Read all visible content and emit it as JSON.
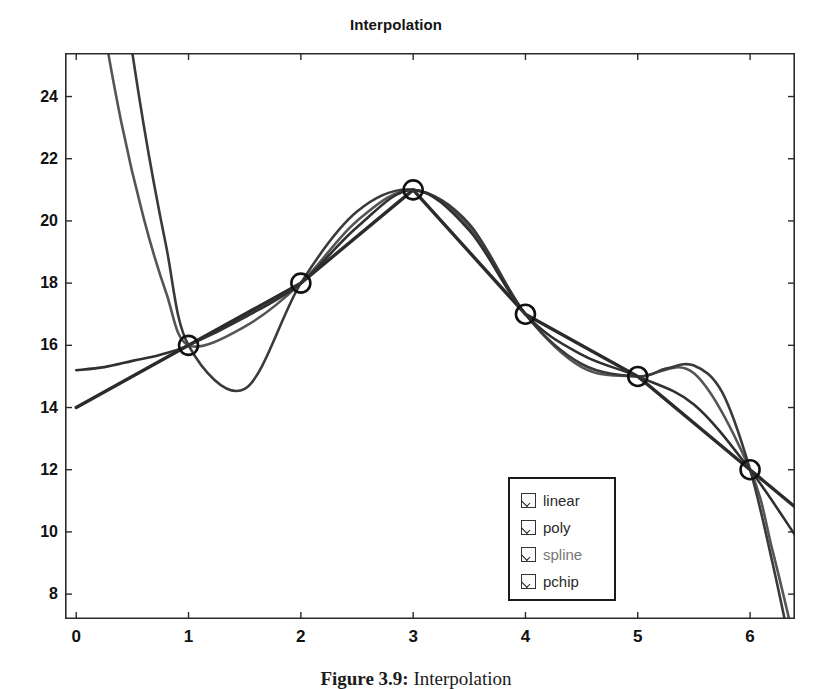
{
  "figure": {
    "caption_bold": "Figure 3.9:",
    "caption_rest": " Interpolation"
  },
  "chart_data": {
    "type": "line",
    "title": "Interpolation",
    "xlabel": "",
    "ylabel": "",
    "xlim": [
      -0.1,
      6.4
    ],
    "ylim": [
      7.2,
      25.4
    ],
    "xticks": [
      0,
      1,
      2,
      3,
      4,
      5,
      6
    ],
    "xtick_labels": [
      "0",
      "1",
      "2",
      "3",
      "4",
      "5",
      "6"
    ],
    "yticks": [
      8,
      10,
      12,
      14,
      16,
      18,
      20,
      22,
      24
    ],
    "ytick_labels": [
      "8",
      "10",
      "12",
      "14",
      "16",
      "18",
      "20",
      "22",
      "24"
    ],
    "grid": false,
    "legend_position": "lower-right",
    "markers": {
      "name": "data points",
      "symbol": "circle-open",
      "x": [
        1,
        2,
        3,
        4,
        5,
        6
      ],
      "y": [
        16,
        18,
        21,
        17,
        15,
        12
      ]
    },
    "series": [
      {
        "name": "linear",
        "color": "#2b2b2b",
        "x": [
          0,
          1,
          2,
          3,
          4,
          5,
          6,
          6.4
        ],
        "y": [
          14.0,
          16.0,
          18.0,
          21.0,
          17.0,
          15.0,
          12.0,
          10.8
        ]
      },
      {
        "name": "poly",
        "color": "#555555",
        "x": [
          0,
          0.2,
          0.4,
          0.6,
          0.8,
          1.0,
          1.5,
          2.0,
          2.5,
          3.0,
          3.5,
          4.0,
          4.5,
          5.0,
          5.5,
          6.0,
          6.2,
          6.4
        ],
        "y": [
          32.0,
          27.2,
          23.2,
          20.1,
          17.7,
          16.0,
          16.6,
          18.0,
          20.0,
          21.0,
          19.8,
          17.0,
          15.3,
          15.0,
          15.1,
          12.0,
          9.4,
          6.4
        ]
      },
      {
        "name": "spline",
        "color": "#3a3a3a",
        "x": [
          0,
          0.2,
          0.4,
          0.6,
          0.8,
          1.0,
          1.5,
          2.0,
          2.5,
          3.0,
          3.5,
          4.0,
          4.5,
          5.0,
          5.25,
          5.5,
          5.75,
          6.0,
          6.2,
          6.4
        ],
        "y": [
          40.0,
          33.6,
          27.9,
          23.1,
          19.2,
          16.0,
          14.6,
          18.0,
          20.3,
          21.0,
          19.9,
          17.0,
          15.4,
          15.0,
          15.25,
          15.35,
          14.5,
          12.0,
          9.0,
          5.6
        ]
      },
      {
        "name": "pchip",
        "color": "#303030",
        "x": [
          0,
          0.25,
          0.5,
          0.75,
          1.0,
          1.5,
          2.0,
          2.5,
          3.0,
          3.5,
          4.0,
          4.5,
          5.0,
          5.5,
          6.0,
          6.4
        ],
        "y": [
          15.2,
          15.3,
          15.5,
          15.7,
          16.0,
          16.9,
          18.0,
          19.8,
          21.0,
          19.7,
          17.0,
          15.7,
          15.0,
          14.1,
          12.0,
          9.9
        ]
      }
    ]
  },
  "legend": {
    "items": [
      {
        "label": "linear",
        "checked": true,
        "faded": false
      },
      {
        "label": "poly",
        "checked": true,
        "faded": false
      },
      {
        "label": "spline",
        "checked": true,
        "faded": true
      },
      {
        "label": "pchip",
        "checked": true,
        "faded": false
      }
    ]
  }
}
